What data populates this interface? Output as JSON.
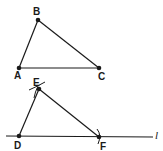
{
  "diagram": {
    "triangle_abc": {
      "points": {
        "A": {
          "label": "A",
          "x": 19,
          "y": 68
        },
        "B": {
          "label": "B",
          "x": 38,
          "y": 20
        },
        "C": {
          "label": "C",
          "x": 99,
          "y": 68
        }
      }
    },
    "triangle_def": {
      "points": {
        "D": {
          "label": "D",
          "x": 19,
          "y": 136
        },
        "E": {
          "label": "E",
          "x": 39,
          "y": 89
        },
        "F": {
          "label": "F",
          "x": 99,
          "y": 137
        }
      }
    },
    "line": {
      "label": "l",
      "x1": 6,
      "y1": 136,
      "x2": 153,
      "y2": 137
    },
    "colors": {
      "stroke": "#1a1a1a",
      "background": "#ffffff"
    }
  }
}
